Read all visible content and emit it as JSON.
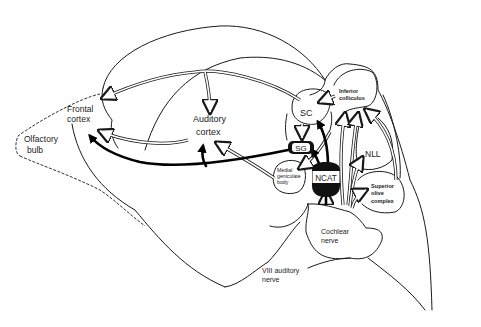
{
  "diagram": {
    "type": "neuroanatomy-sagittal-schematic",
    "regions": {
      "frontal_cortex": "Frontal\ncortex",
      "frontal_line1": "Frontal",
      "frontal_line2": "cortex",
      "olfactory_line1": "Olfactory",
      "olfactory_line2": "bulb",
      "auditory_line1": "Auditory",
      "auditory_line2": "cortex",
      "sc": "SC",
      "sg": "SG",
      "ncat": "NCAT",
      "inferior_line1": "Inferior",
      "inferior_line2": "colliculus",
      "nll": "NLL",
      "mgb_line1": "Medial",
      "mgb_line2": "geniculate",
      "mgb_line3": "body",
      "soc_line1": "Superior",
      "soc_line2": "olive",
      "soc_line3": "complex",
      "cochlear_line1": "Cochlear",
      "cochlear_line2": "nerve",
      "viii_line1": "VIII auditory",
      "viii_line2": "nerve"
    },
    "connections": {
      "hollow": [
        {
          "from": "SC",
          "to": "Frontal cortex"
        },
        {
          "from": "SC",
          "to": "Auditory cortex"
        },
        {
          "from": "Inferior colliculus",
          "to": "SC"
        },
        {
          "from": "SC",
          "to": "SG"
        },
        {
          "from": "Auditory cortex",
          "to": "Frontal cortex"
        },
        {
          "from": "Medial geniculate body",
          "to": "Auditory cortex"
        },
        {
          "from": "Inferior colliculus",
          "to": "Medial geniculate body"
        },
        {
          "from": "Cochlear nerve",
          "to": "Inferior colliculus"
        },
        {
          "from": "Cochlear nerve",
          "to": "NLL"
        },
        {
          "from": "Cochlear nerve",
          "to": "Superior olive complex"
        },
        {
          "from": "Superior olive complex",
          "to": "Inferior colliculus"
        },
        {
          "from": "Cochlear nerve",
          "to": "NCAT"
        }
      ],
      "solid": [
        {
          "from": "SG",
          "to": "Frontal cortex"
        },
        {
          "from": "SG",
          "to": "Auditory cortex"
        },
        {
          "from": "NCAT",
          "to": "SC"
        },
        {
          "from": "NCAT",
          "to": "SG"
        }
      ]
    },
    "colors": {
      "line": "#1a1a1a",
      "solid_node_fill": "#111111",
      "background": "#ffffff"
    }
  }
}
